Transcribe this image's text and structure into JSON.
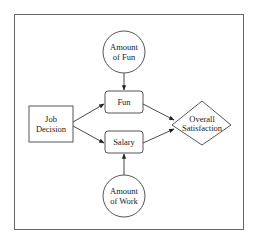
{
  "diagram": {
    "type": "influence-diagram",
    "nodes": [
      {
        "id": "job_decision",
        "shape": "rectangle",
        "role": "decision",
        "lines": [
          "Job",
          "Decision"
        ]
      },
      {
        "id": "amount_fun",
        "shape": "circle",
        "role": "chance",
        "lines": [
          "Amount",
          "of Fun"
        ]
      },
      {
        "id": "fun",
        "shape": "rounded-rectangle",
        "role": "consequence",
        "lines": [
          "Fun"
        ]
      },
      {
        "id": "salary",
        "shape": "rounded-rectangle",
        "role": "consequence",
        "lines": [
          "Salary"
        ]
      },
      {
        "id": "amount_work",
        "shape": "circle",
        "role": "chance",
        "lines": [
          "Amount",
          "of Work"
        ]
      },
      {
        "id": "overall_satisfaction",
        "shape": "diamond",
        "role": "value",
        "lines": [
          "Overall",
          "Satisfaction"
        ]
      }
    ],
    "edges": [
      {
        "from": "amount_fun",
        "to": "fun"
      },
      {
        "from": "job_decision",
        "to": "fun"
      },
      {
        "from": "job_decision",
        "to": "salary"
      },
      {
        "from": "amount_work",
        "to": "salary"
      },
      {
        "from": "fun",
        "to": "overall_satisfaction"
      },
      {
        "from": "salary",
        "to": "overall_satisfaction"
      }
    ]
  },
  "labels": {
    "job_decision": {
      "line1": "Job",
      "line2": "Decision"
    },
    "amount_fun": {
      "line1": "Amount",
      "line2": "of Fun"
    },
    "fun": {
      "line1": "Fun"
    },
    "salary": {
      "line1": "Salary"
    },
    "amount_work": {
      "line1": "Amount",
      "line2": "of Work"
    },
    "overall_satisfaction": {
      "line1": "Overall",
      "line2": "Satisfaction"
    }
  }
}
